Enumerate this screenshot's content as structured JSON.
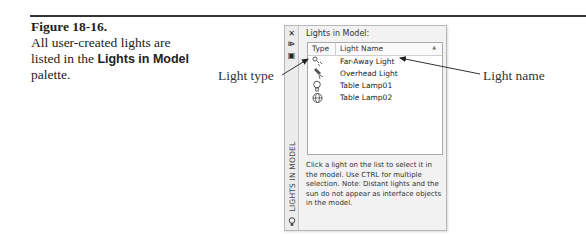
{
  "figure": {
    "number": "Figure 18-16.",
    "caption_pre": "All user-created lights are listed in the",
    "caption_bold": "Lights in Model",
    "caption_post": "palette."
  },
  "callouts": {
    "left": "Light type",
    "right": "Light name"
  },
  "palette": {
    "title_vertical": "LIGHTS IN MODEL",
    "heading": "Lights in Model:",
    "columns": [
      "Type",
      "Light Name"
    ],
    "rows": [
      {
        "type_icon": "distant-light-icon",
        "name": "Far-Away Light"
      },
      {
        "type_icon": "spotlight-icon",
        "name": "Overhead Light"
      },
      {
        "type_icon": "point-light-icon",
        "name": "Table Lamp01"
      },
      {
        "type_icon": "web-light-icon",
        "name": "Table Lamp02"
      }
    ],
    "note": "Click a light on the list to select it in the model. Use CTRL for multiple selection. Note: Distant lights and the sun do not appear as interface objects in the model."
  }
}
